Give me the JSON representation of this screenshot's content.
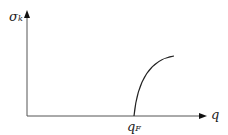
{
  "diagram": {
    "y_axis_label": "σ",
    "y_axis_label_sub": "k",
    "x_axis_label": "q",
    "marker_label": "q",
    "marker_label_sub": "F",
    "curve": "monotonic increasing concave curve starting at q_F on the q axis"
  }
}
